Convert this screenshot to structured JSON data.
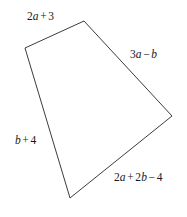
{
  "figure": {
    "type": "quadrilateral",
    "background_color": "#ffffff",
    "stroke_color": "#3c3c3c",
    "stroke_width": 1,
    "fill": "none",
    "width": 187,
    "height": 217,
    "vertices": [
      {
        "name": "top-left-vertex",
        "x": 25,
        "y": 48
      },
      {
        "name": "top-vertex",
        "x": 84,
        "y": 21
      },
      {
        "name": "right-vertex",
        "x": 172,
        "y": 116
      },
      {
        "name": "bottom-vertex",
        "x": 70,
        "y": 198
      }
    ],
    "points_attr": "25,48 84,21 172,116 70,198",
    "labels": {
      "top_left": {
        "text": "2a + 3",
        "parts": [
          {
            "kind": "num",
            "text": "2"
          },
          {
            "kind": "var",
            "text": "a"
          },
          {
            "kind": "op",
            "text": "+"
          },
          {
            "kind": "num",
            "text": "3"
          }
        ]
      },
      "top_right": {
        "text": "3a − b",
        "parts": [
          {
            "kind": "num",
            "text": "3"
          },
          {
            "kind": "var",
            "text": "a"
          },
          {
            "kind": "op",
            "text": "−"
          },
          {
            "kind": "var",
            "text": "b"
          }
        ]
      },
      "left": {
        "text": "b + 4",
        "parts": [
          {
            "kind": "var",
            "text": "b"
          },
          {
            "kind": "op",
            "text": "+"
          },
          {
            "kind": "num",
            "text": "4"
          }
        ]
      },
      "bottom": {
        "text": "2a + 2b − 4",
        "parts": [
          {
            "kind": "num",
            "text": "2"
          },
          {
            "kind": "var",
            "text": "a"
          },
          {
            "kind": "op",
            "text": "+"
          },
          {
            "kind": "num",
            "text": "2"
          },
          {
            "kind": "var",
            "text": "b"
          },
          {
            "kind": "op",
            "text": "−"
          },
          {
            "kind": "num",
            "text": "4"
          }
        ]
      }
    }
  }
}
